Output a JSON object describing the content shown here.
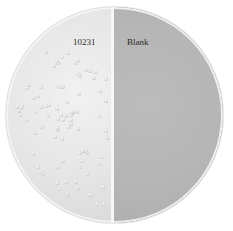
{
  "image": {
    "subject": "petri dish divided into two halves",
    "labels": {
      "left": "10231",
      "right": "Blank"
    },
    "colors": {
      "left_half": "#e6e6e6",
      "right_half": "#b5b5b5",
      "divider": "#f7f7f7",
      "colony": "#d4d4d4"
    }
  }
}
